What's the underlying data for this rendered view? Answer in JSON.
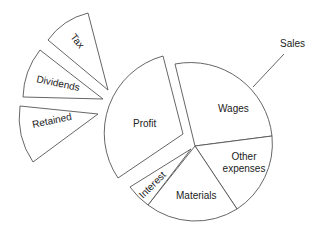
{
  "diagram": {
    "type": "exploded-pie",
    "title": "Sales",
    "main_pie": {
      "label": "Sales",
      "segments": [
        {
          "label": "Wages"
        },
        {
          "label": "Other expenses",
          "lines": [
            "Other",
            "expenses"
          ]
        },
        {
          "label": "Materials"
        },
        {
          "label": "Interest"
        },
        {
          "label": "Profit"
        }
      ]
    },
    "profit_breakdown": {
      "segments": [
        {
          "label": "Tax"
        },
        {
          "label": "Dividends"
        },
        {
          "label": "Retained"
        }
      ]
    },
    "colors": {
      "stroke": "#555555",
      "fill": "#ffffff",
      "text": "#222222"
    }
  }
}
